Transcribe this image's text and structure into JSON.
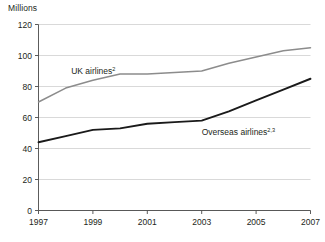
{
  "figure": {
    "unit_label": "Millions"
  },
  "chart_data": {
    "type": "line",
    "title": "",
    "subtitle": "",
    "xlabel": "",
    "ylabel": "Millions",
    "xlim": [
      1997,
      2007
    ],
    "ylim": [
      0,
      120
    ],
    "ytick_step": 20,
    "xtick_step": 2,
    "grid": "horizontal",
    "legend": "inline-annotations",
    "x": [
      1997,
      1998,
      1999,
      2000,
      2001,
      2002,
      2003,
      2004,
      2005,
      2006,
      2007
    ],
    "ytick_labels": [
      "0",
      "20",
      "40",
      "60",
      "80",
      "100",
      "120"
    ],
    "ytick_values": [
      0,
      20,
      40,
      60,
      80,
      100,
      120
    ],
    "xtick_labels": [
      "1997",
      "1999",
      "2001",
      "2003",
      "2005",
      "2007"
    ],
    "xtick_values": [
      1997,
      1999,
      2001,
      2003,
      2005,
      2007
    ],
    "series": [
      {
        "name": "UK airlines",
        "name_superscript": "2",
        "color": "#8c8c8c",
        "stroke_width": 1.5,
        "label_x": 1998.2,
        "label_y": 88,
        "values": [
          70,
          79,
          84,
          88,
          88,
          89,
          90,
          95,
          99,
          103,
          105
        ]
      },
      {
        "name": "Overseas airlines",
        "name_superscript": "2,3",
        "color": "#1a1a1a",
        "stroke_width": 1.9,
        "label_x": 2003.0,
        "label_y": 49,
        "values": [
          44,
          48,
          52,
          53,
          56,
          57,
          58,
          64,
          71,
          78,
          85
        ]
      }
    ],
    "annotations": [
      {
        "text": "UK airlines",
        "superscript": "2"
      },
      {
        "text": "Overseas airlines",
        "superscript": "2,3"
      }
    ]
  }
}
